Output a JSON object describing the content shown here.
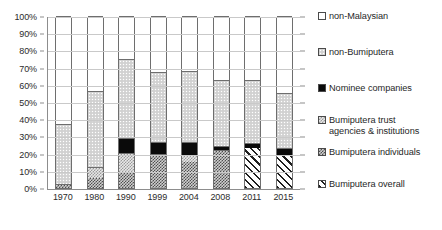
{
  "chart_data": {
    "type": "bar",
    "subtype": "stacked-bar-100pct",
    "title": "",
    "xlabel": "",
    "ylabel": "",
    "ylim": [
      0,
      100
    ],
    "ytick_labels": [
      "0%",
      "10%",
      "20%",
      "30%",
      "40%",
      "50%",
      "60%",
      "70%",
      "80%",
      "90%",
      "100%"
    ],
    "ytick_values": [
      0,
      10,
      20,
      30,
      40,
      50,
      60,
      70,
      80,
      90,
      100
    ],
    "grid": true,
    "legend_position": "right",
    "categories": [
      "1970",
      "1980",
      "1990",
      "1999",
      "2004",
      "2008",
      "2011",
      "2015"
    ],
    "series": [
      {
        "name": "Bumiputera overall",
        "pattern": "diagonal-hatch",
        "values": [
          null,
          null,
          null,
          null,
          null,
          null,
          23.5,
          18.5
        ]
      },
      {
        "name": "Bumiputera individuals",
        "pattern": "checker-dark",
        "values": [
          1.5,
          6.0,
          8.5,
          18.5,
          15.0,
          21.5,
          null,
          null
        ]
      },
      {
        "name": "Bumiputera trust agencies & institutions",
        "pattern": "checker-light",
        "values": [
          0.9,
          6.5,
          12.0,
          1.0,
          4.0,
          0.5,
          null,
          null
        ]
      },
      {
        "name": "Nominee companies",
        "pattern": "solid-black",
        "values": [
          0,
          0,
          8.5,
          7.5,
          8.0,
          2.5,
          2.5,
          4.5
        ]
      },
      {
        "name": "non-Bumiputera",
        "pattern": "light-gray-dotted",
        "values": [
          34.6,
          44.0,
          46.0,
          40.5,
          41.0,
          38.5,
          37.0,
          32.0
        ]
      },
      {
        "name": "non-Malaysian",
        "pattern": "white",
        "values": [
          63.0,
          43.5,
          25.0,
          32.5,
          32.0,
          37.0,
          37.0,
          45.0
        ]
      }
    ],
    "cumulative_tops": {
      "1970": {
        "bumiputera_individuals": 1.5,
        "bumiputera_trust": 2.4,
        "nominee": 2.4,
        "non_bumiputera": 37.0,
        "non_malaysian": 100
      },
      "1980": {
        "bumiputera_individuals": 6.0,
        "bumiputera_trust": 12.5,
        "nominee": 12.5,
        "non_bumiputera": 56.5,
        "non_malaysian": 100
      },
      "1990": {
        "bumiputera_individuals": 8.5,
        "bumiputera_trust": 20.5,
        "nominee": 29.0,
        "non_bumiputera": 75.0,
        "non_malaysian": 100
      },
      "1999": {
        "bumiputera_individuals": 18.5,
        "bumiputera_trust": 19.5,
        "nominee": 27.0,
        "non_bumiputera": 67.5,
        "non_malaysian": 100
      },
      "2004": {
        "bumiputera_individuals": 15.0,
        "bumiputera_trust": 19.0,
        "nominee": 27.0,
        "non_bumiputera": 68.0,
        "non_malaysian": 100
      },
      "2008": {
        "bumiputera_individuals": 21.5,
        "bumiputera_trust": 22.0,
        "nominee": 24.5,
        "non_bumiputera": 63.0,
        "non_malaysian": 100
      },
      "2011": {
        "bumiputera_overall": 23.5,
        "nominee": 26.0,
        "non_bumiputera": 63.0,
        "non_malaysian": 100
      },
      "2015": {
        "bumiputera_overall": 18.5,
        "nominee": 23.0,
        "non_bumiputera": 55.0,
        "non_malaysian": 100
      }
    }
  },
  "legend": {
    "items": [
      {
        "label": "non-Malaysian",
        "swatch": "white"
      },
      {
        "label": "non-Bumiputera",
        "swatch": "light-gray-dotted"
      },
      {
        "label": "Nominee companies",
        "swatch": "solid-black"
      },
      {
        "label": "Bumiputera trust\nagencies & institutions",
        "swatch": "checker-light"
      },
      {
        "label": "Bumiputera individuals",
        "swatch": "checker-dark"
      },
      {
        "label": "Bumiputera overall",
        "swatch": "diagonal-hatch"
      }
    ]
  },
  "colors": {
    "axis": "#8d8d8d",
    "gridline": "#c9c9c9",
    "bar_outline": "#6e6e6e",
    "text": "#1f1f1f",
    "nominee_black": "#0a0a0a",
    "non_bumiputera_gray": "#d6d6d6",
    "background": "#ffffff"
  }
}
